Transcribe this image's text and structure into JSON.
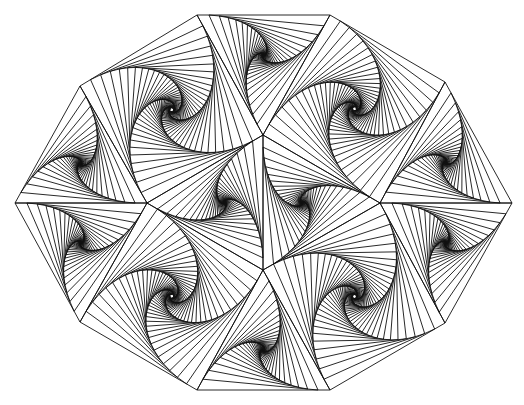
{
  "figure": {
    "title": "Pursuit-curve spiral tiling",
    "canvas": {
      "width": 524,
      "height": 405,
      "background": "#ffffff"
    },
    "stroke": {
      "color": "#111111",
      "width": 0.9
    },
    "pursuit": {
      "fraction": 0.09,
      "iterations": 42
    },
    "vertices": {
      "O0": [
        197,
        15
      ],
      "O1": [
        330,
        15
      ],
      "O2": [
        445,
        82
      ],
      "O3": [
        512,
        203
      ],
      "O4": [
        445,
        323
      ],
      "O5": [
        330,
        390
      ],
      "O6": [
        197,
        390
      ],
      "O7": [
        80,
        322
      ],
      "O8": [
        15,
        203
      ],
      "O9": [
        80,
        86
      ],
      "A": [
        263,
        135
      ],
      "B": [
        263,
        270
      ],
      "L": [
        147,
        203
      ],
      "R": [
        380,
        203
      ]
    },
    "tiles": [
      {
        "name": "upper-left-rhombus",
        "shape": "quad",
        "verts": [
          "O9",
          "O0",
          "A",
          "L"
        ]
      },
      {
        "name": "top-triangle",
        "shape": "tri",
        "verts": [
          "O0",
          "O1",
          "A"
        ]
      },
      {
        "name": "upper-right-rhombus",
        "shape": "quad",
        "verts": [
          "O1",
          "O2",
          "R",
          "A"
        ]
      },
      {
        "name": "right-upper-triangle",
        "shape": "tri",
        "verts": [
          "O2",
          "O3",
          "R"
        ]
      },
      {
        "name": "right-lower-triangle",
        "shape": "tri",
        "verts": [
          "O3",
          "O4",
          "R"
        ]
      },
      {
        "name": "lower-right-rhombus",
        "shape": "quad",
        "verts": [
          "O4",
          "O5",
          "B",
          "R"
        ]
      },
      {
        "name": "bottom-triangle",
        "shape": "tri",
        "verts": [
          "O5",
          "O6",
          "B"
        ]
      },
      {
        "name": "lower-left-rhombus",
        "shape": "quad",
        "verts": [
          "O6",
          "O7",
          "L",
          "B"
        ]
      },
      {
        "name": "left-lower-triangle",
        "shape": "tri",
        "verts": [
          "O7",
          "O8",
          "L"
        ]
      },
      {
        "name": "left-upper-triangle",
        "shape": "tri",
        "verts": [
          "O8",
          "O9",
          "L"
        ]
      },
      {
        "name": "center-left-triangle",
        "shape": "tri",
        "verts": [
          "A",
          "L",
          "B"
        ]
      },
      {
        "name": "center-right-triangle",
        "shape": "tri",
        "verts": [
          "A",
          "B",
          "R"
        ]
      }
    ]
  }
}
